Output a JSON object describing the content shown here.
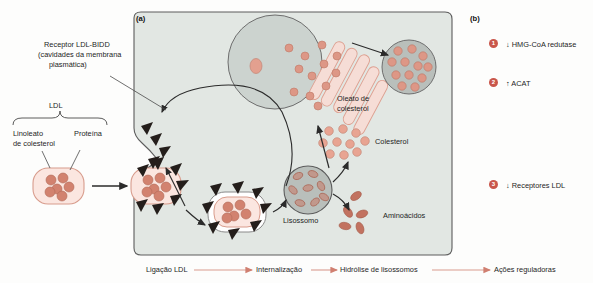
{
  "figure": {
    "panel_a_tag": "(a)",
    "panel_b_tag": "(b)"
  },
  "panel_a": {
    "labels": {
      "receptor_line1": "Receptor LDL-BIDD",
      "receptor_line2": "(cavidades da membrana",
      "receptor_line3": "plasmática)",
      "ldl_bracket": "LDL",
      "linoleato_line1": "Linoleato",
      "linoleato_line2": "de colesterol",
      "proteina": "Proteína",
      "lisossomo": "Lisossomo",
      "colesterol": "Colesterol",
      "aminoacidos": "Aminoácidos",
      "oleato_line1": "Oleato de",
      "oleato_line2": "colesterol"
    }
  },
  "bottom_flow": {
    "steps": [
      {
        "label": "Ligação LDL"
      },
      {
        "label": "Internalização"
      },
      {
        "label": "Hidrólise de lisossomos"
      },
      {
        "label": "Ações reguladoras"
      }
    ]
  },
  "panel_b": {
    "items": [
      {
        "number": "1",
        "label": "↓ HMG-CoA redutase"
      },
      {
        "number": "2",
        "label": "↑ ACAT"
      },
      {
        "number": "3",
        "label": "↓ Receptores LDL"
      }
    ]
  },
  "colors": {
    "cytoplasm": "#e2e7e3",
    "nucleus": "#ccd3cf",
    "salmon": "#e9a595",
    "salmon_dark": "#c9564a",
    "lipid": "#d89484",
    "membrane_line": "#4a4a4a",
    "receptor": "#2b2320",
    "flow_arrow": "#d99b8e",
    "text": "#1e1e1e"
  }
}
